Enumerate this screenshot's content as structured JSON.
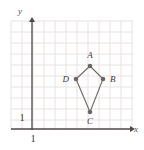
{
  "figure": {
    "background_color": "#ffffff",
    "grid": {
      "color": "#e9e2e2",
      "spacing_px": 11,
      "left_px": 11,
      "top_px": 21,
      "right_px": 133,
      "bottom_px": 130,
      "visible": true
    },
    "axes": {
      "color": "#4c4847",
      "x": {
        "label": "x",
        "label_x": 136,
        "label_y": 132,
        "y_px": 129,
        "start_px": 11,
        "end_px": 130,
        "arrow": true,
        "unit_label": "1",
        "unit_label_x": 33,
        "unit_label_y": 142
      },
      "y": {
        "label": "y",
        "label_x": 20,
        "label_y": 14,
        "x_px": 32,
        "start_px": 130,
        "end_px": 22,
        "arrow": true,
        "unit_label": "1",
        "unit_label_x": 22,
        "unit_label_y": 121
      }
    },
    "shape": {
      "name": "kite-abcd",
      "stroke_color": "#6e6a69",
      "stroke_width": 1.1,
      "fill": "none",
      "vertex_dot_color": "#6b6766",
      "vertex_dot_radius": 2.3,
      "vertices": [
        {
          "label": "A",
          "x": 90,
          "y": 66,
          "label_x": 90,
          "label_y": 58,
          "label_anchor": "middle"
        },
        {
          "label": "B",
          "x": 103,
          "y": 79,
          "label_x": 110,
          "label_y": 82,
          "label_anchor": "start"
        },
        {
          "label": "C",
          "x": 90,
          "y": 112,
          "label_x": 90,
          "label_y": 124,
          "label_anchor": "middle"
        },
        {
          "label": "D",
          "x": 76,
          "y": 79,
          "label_x": 69,
          "label_y": 82,
          "label_anchor": "end"
        }
      ]
    }
  }
}
